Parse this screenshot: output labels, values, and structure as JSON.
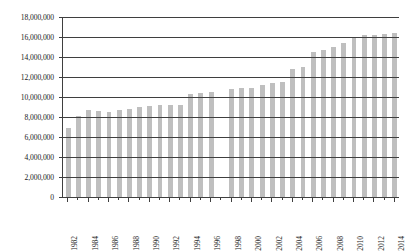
{
  "chart_data": {
    "type": "bar",
    "title": "",
    "subtitle": "",
    "xlabel": "",
    "ylabel": "",
    "ylim": [
      0,
      18000000
    ],
    "ytick_step": 2000000,
    "grid": true,
    "legend": false,
    "legend_position": "none",
    "bar_color": "#bfbfbf",
    "axis_color": "#3f3f3f",
    "text_color": "#1a1a1a",
    "y_tick_labels": [
      "18,000,000",
      "16,000,000",
      "14,000,000",
      "12,000,000",
      "10,000,000",
      "8,000,000",
      "6,000,000",
      "4,000,000",
      "2,000,000",
      "0"
    ],
    "y_tick_values": [
      18000000,
      16000000,
      14000000,
      12000000,
      10000000,
      8000000,
      6000000,
      4000000,
      2000000,
      0
    ],
    "x_tick_labels": [
      "1982",
      "1984",
      "1986",
      "1988",
      "1990",
      "1992",
      "1994",
      "1996",
      "1998",
      "2000",
      "2002",
      "2004",
      "2006",
      "2008",
      "2010",
      "2012",
      "2014"
    ],
    "categories": [
      "1982",
      "1983",
      "1984",
      "1985",
      "1986",
      "1987",
      "1988",
      "1989",
      "1990",
      "1991",
      "1992",
      "1993",
      "1994",
      "1995",
      "1996",
      "1997",
      "1998",
      "1999",
      "2000",
      "2001",
      "2002",
      "2003",
      "2004",
      "2005",
      "2006",
      "2007",
      "2008",
      "2009",
      "2010",
      "2011",
      "2012",
      "2013",
      "2014"
    ],
    "values": [
      6900000,
      8100000,
      8700000,
      8600000,
      8500000,
      8700000,
      8800000,
      9000000,
      9100000,
      9200000,
      9200000,
      9200000,
      10300000,
      10400000,
      10500000,
      null,
      10800000,
      10900000,
      10900000,
      11200000,
      11400000,
      11500000,
      12800000,
      13000000,
      14500000,
      14700000,
      15000000,
      15400000,
      15900000,
      16200000,
      16200000,
      16300000,
      16400000
    ],
    "missing_categories": [
      "1997"
    ]
  }
}
